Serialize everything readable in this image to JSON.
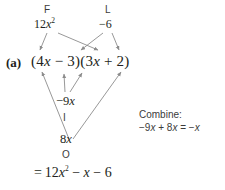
{
  "figure": {
    "kind": "foil-method-diagram",
    "background_color": "#ffffff",
    "ink_color": "#231f20",
    "arrow_color": "#8c8c8c"
  },
  "problem_label": "(a)",
  "expression": {
    "full": "(4x − 3)(3x + 2)",
    "left_open": "(4",
    "left_var": "x",
    "left_op": " − 3)(3",
    "right_var": "x",
    "right_close": " + 2)"
  },
  "foil_terms": {
    "first": {
      "letter": "F",
      "value_prefix": "12",
      "value_var": "x",
      "value_exp": "2",
      "value_plain": "12x²"
    },
    "outer": {
      "letter": "O",
      "value_prefix": "8",
      "value_var": "x",
      "value_plain": "8x"
    },
    "inner": {
      "letter": "I",
      "value_prefix": "−9",
      "value_var": "x",
      "value_plain": "−9x"
    },
    "last": {
      "letter": "L",
      "value_plain": "−6"
    }
  },
  "combine_note": {
    "heading": "Combine:",
    "equation_prefix": "−9",
    "equation_var1": "x",
    "equation_mid": " + 8",
    "equation_var2": "x",
    "equation_equals": " = −",
    "equation_var3": "x",
    "equation_plain": "−9x + 8x = −x"
  },
  "result_line": {
    "equals": "= ",
    "coef": "12",
    "var1": "x",
    "exp": "2",
    "mid": " − ",
    "var2": "x",
    "tail": " − 6",
    "plain": "= 12x² − x − 6"
  },
  "arrows": [
    {
      "name": "first-to-4x",
      "from": [
        47,
        33
      ],
      "to": [
        40,
        52
      ]
    },
    {
      "name": "first-to-3x",
      "from": [
        57,
        33
      ],
      "to": [
        99,
        52
      ]
    },
    {
      "name": "last-to-4x",
      "from": [
        103,
        33
      ],
      "to": [
        80,
        52
      ]
    },
    {
      "name": "last-to-2",
      "from": [
        112,
        33
      ],
      "to": [
        119,
        52
      ]
    },
    {
      "name": "outer-to-4x",
      "from": [
        68,
        140
      ],
      "to": [
        42,
        72
      ]
    },
    {
      "name": "inner-to-3",
      "from": [
        65,
        95
      ],
      "to": [
        64,
        74
      ]
    },
    {
      "name": "inner-to-3x2",
      "from": [
        70,
        95
      ],
      "to": [
        82,
        73
      ]
    },
    {
      "name": "outer-to-2",
      "from": [
        71,
        140
      ],
      "to": [
        121,
        72
      ]
    }
  ]
}
